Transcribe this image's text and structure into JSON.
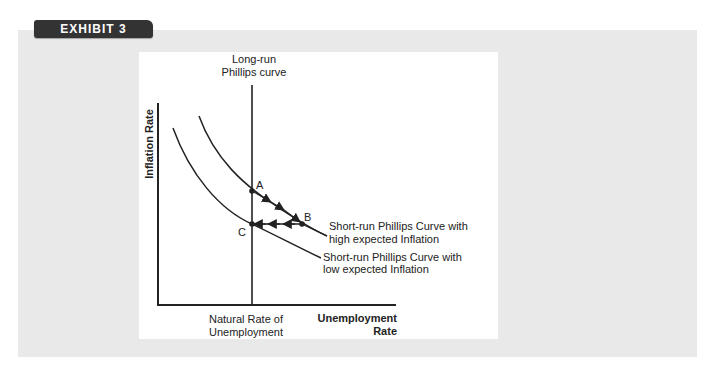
{
  "exhibit": {
    "label": "EXHIBIT 3"
  },
  "colors": {
    "badge_bg": "#333333",
    "panel_bg": "#e9e9e9",
    "plot_bg": "#ffffff",
    "ink": "#222222"
  },
  "diagram": {
    "title_line1": "Long-run",
    "title_line2": "Phillips curve",
    "y_axis_label": "Inflation Rate",
    "x_axis_label_line1": "Unemployment",
    "x_axis_label_line2": "Rate",
    "natural_rate_line1": "Natural Rate of",
    "natural_rate_line2": "Unemployment",
    "points": {
      "a": "A",
      "b": "B",
      "c": "C"
    },
    "high_curve_label_line1": "Short-run Phillips Curve with",
    "high_curve_label_line2": "high expected Inflation",
    "low_curve_label_line1": "Short-run Phillips Curve with",
    "low_curve_label_line2": "low expected Inflation"
  }
}
